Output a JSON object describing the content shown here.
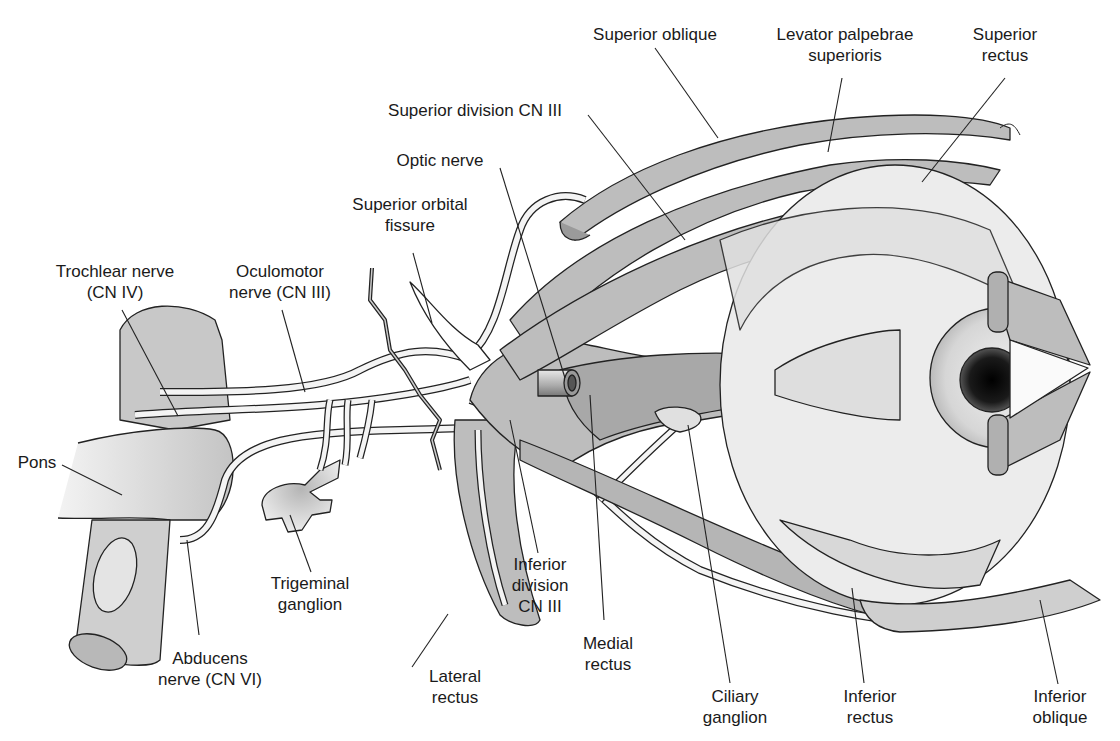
{
  "diagram": {
    "colors": {
      "background": "#ffffff",
      "muscle_fill": "#bdbdbd",
      "muscle_dark": "#9a9a9a",
      "nerve_fill": "#f4f4f4",
      "outline": "#222222",
      "eyeball": "#ececec",
      "pupil": "#111111"
    },
    "labels": [
      {
        "id": "superior-oblique",
        "lines": [
          "Superior oblique"
        ],
        "x": 655,
        "y": 26
      },
      {
        "id": "levator-palpebrae-superioris",
        "lines": [
          "Levator palpebrae",
          "superioris"
        ],
        "x": 843,
        "y": 26
      },
      {
        "id": "superior-rectus",
        "lines": [
          "Superior",
          "rectus"
        ],
        "x": 1008,
        "y": 26
      },
      {
        "id": "superior-division-cn-iii",
        "lines": [
          "Superior division CN III"
        ],
        "x": 458,
        "y": 102
      },
      {
        "id": "optic-nerve",
        "lines": [
          "Optic nerve"
        ],
        "x": 440,
        "y": 152
      },
      {
        "id": "superior-orbital-fissure",
        "lines": [
          "Superior orbital",
          "fissure"
        ],
        "x": 410,
        "y": 196
      },
      {
        "id": "trochlear-nerve",
        "lines": [
          "Trochlear nerve",
          "(CN IV)"
        ],
        "x": 118,
        "y": 262
      },
      {
        "id": "oculomotor-nerve",
        "lines": [
          "Oculomotor",
          "nerve (CN III)"
        ],
        "x": 280,
        "y": 262
      },
      {
        "id": "pons",
        "lines": [
          "Pons"
        ],
        "x": 36,
        "y": 453
      },
      {
        "id": "trigeminal-ganglion",
        "lines": [
          "Trigeminal",
          "ganglion"
        ],
        "x": 311,
        "y": 571
      },
      {
        "id": "abducens-nerve",
        "lines": [
          "Abducens",
          "nerve (CN VI)"
        ],
        "x": 199,
        "y": 647
      },
      {
        "id": "lateral-rectus",
        "lines": [
          "Lateral",
          "rectus"
        ],
        "x": 412,
        "y": 666
      },
      {
        "id": "inferior-division-cn-iii",
        "lines": [
          "Inferior",
          "division",
          "CN III"
        ],
        "x": 539,
        "y": 553
      },
      {
        "id": "medial-rectus",
        "lines": [
          "Medial",
          "rectus"
        ],
        "x": 604,
        "y": 632
      },
      {
        "id": "ciliary-ganglion",
        "lines": [
          "Ciliary",
          "ganglion"
        ],
        "x": 734,
        "y": 684
      },
      {
        "id": "inferior-rectus",
        "lines": [
          "Inferior",
          "rectus"
        ],
        "x": 864,
        "y": 684
      },
      {
        "id": "inferior-oblique",
        "lines": [
          "Inferior",
          "oblique"
        ],
        "x": 1058,
        "y": 684
      }
    ]
  }
}
